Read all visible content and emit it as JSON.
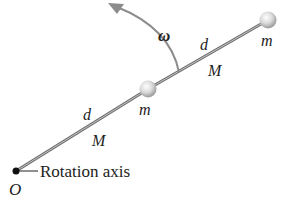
{
  "diagram": {
    "type": "rotating rod with masses",
    "labels": {
      "omega": "ω",
      "rod1_length": "d",
      "rod1_mass": "M",
      "rod2_length": "d",
      "rod2_mass": "M",
      "mass_middle": "m",
      "mass_end": "m",
      "axis_label": "Rotation axis",
      "origin": "O"
    },
    "colors": {
      "rod": "#8a8a8a",
      "sphere": "#d8d8d8",
      "arrow": "#8c8c8c",
      "pivot": "#111111",
      "text": "#222222"
    }
  }
}
